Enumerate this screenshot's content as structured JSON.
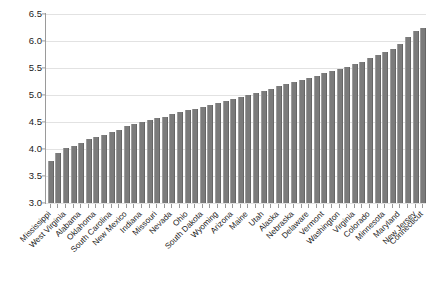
{
  "chart_data": {
    "type": "bar",
    "title": "",
    "subtitle": "",
    "xlabel": "",
    "ylabel": "",
    "ylim": [
      3.0,
      6.5
    ],
    "ytick_labels": [
      "3.0",
      "3.5",
      "4.0",
      "4.5",
      "5.0",
      "5.5",
      "6.0",
      "6.5"
    ],
    "ytick_values": [
      3.0,
      3.5,
      4.0,
      4.5,
      5.0,
      5.5,
      6.0,
      6.5
    ],
    "grid": true,
    "grid_axis": "y",
    "legend": "none",
    "bar_color": "#7b7b7b",
    "background_color": "#ffffff",
    "axis_color": "#9a9a9a",
    "gridline_color": "#e2e2e2",
    "label_rotation": -45,
    "labels_every_nth": 2,
    "categories": [
      "Mississippi",
      "",
      "West Virginia",
      "",
      "Alabama",
      "",
      "Oklahoma",
      "",
      "South Carolina",
      "",
      "New Mexico",
      "",
      "Indiana",
      "",
      "Missouri",
      "",
      "Nevada",
      "",
      "Ohio",
      "",
      "South Dakota",
      "",
      "Wyoming",
      "",
      "Arizona",
      "",
      "Maine",
      "",
      "Utah",
      "",
      "Alaska",
      "",
      "Nebraska",
      "",
      "Delaware",
      "",
      "Vermont",
      "",
      "Washington",
      "",
      "Virginia",
      "",
      "Colorado",
      "",
      "Minnesota",
      "",
      "Maryland",
      "",
      "New Jersey",
      "Connecticut"
    ],
    "values": [
      3.78,
      3.92,
      4.02,
      4.06,
      4.12,
      4.18,
      4.22,
      4.26,
      4.32,
      4.36,
      4.42,
      4.46,
      4.5,
      4.54,
      4.58,
      4.6,
      4.64,
      4.68,
      4.72,
      4.74,
      4.78,
      4.82,
      4.86,
      4.88,
      4.92,
      4.96,
      5.0,
      5.04,
      5.08,
      5.12,
      5.16,
      5.2,
      5.24,
      5.28,
      5.32,
      5.36,
      5.4,
      5.44,
      5.48,
      5.52,
      5.58,
      5.62,
      5.68,
      5.74,
      5.8,
      5.86,
      5.95,
      6.08,
      6.18,
      6.24
    ]
  }
}
